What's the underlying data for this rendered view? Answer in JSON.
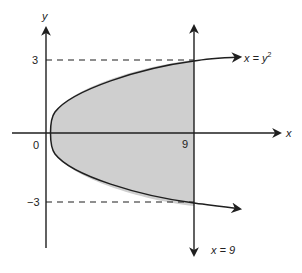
{
  "diagram": {
    "colors": {
      "background": "#ffffff",
      "stroke": "#1f1f1f",
      "shaded_region": "#cfcfcf"
    },
    "axes": {
      "x_label": "x",
      "y_label": "y",
      "origin_label": "0"
    },
    "ticks": {
      "y_top": "3",
      "y_bottom": "−3",
      "x_right": "9"
    },
    "curves": {
      "parabola_label_prefix": "x = y",
      "parabola_label_exponent": "2",
      "line_label": "x = 9"
    }
  }
}
